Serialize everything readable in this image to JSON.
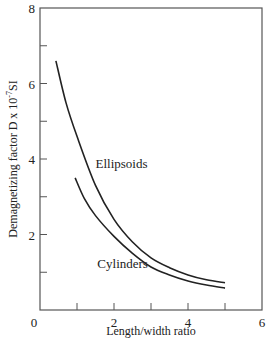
{
  "chart_data": {
    "type": "line",
    "title": "",
    "xlabel": "Length/width ratio",
    "ylabel": "Demagnetizing factor  D x 10",
    "ylabel_sup": "-7",
    "ylabel_unit": "SI",
    "xlim": [
      0,
      6
    ],
    "ylim": [
      0,
      8
    ],
    "x_ticks": [
      0,
      1,
      2,
      3,
      4,
      5,
      6
    ],
    "x_tick_labels": [
      "0",
      "",
      "2",
      "",
      "4",
      "",
      "6"
    ],
    "y_ticks": [
      0,
      1,
      2,
      3,
      4,
      5,
      6,
      7,
      8
    ],
    "y_tick_labels": [
      "",
      "",
      "2",
      "",
      "4",
      "",
      "6",
      "",
      "8"
    ],
    "grid": false,
    "legend": "none (inline curve labels)",
    "series": [
      {
        "name": "Ellipsoids",
        "x": [
          0.43,
          0.7,
          1.0,
          1.5,
          2.0,
          2.5,
          3.0,
          3.5,
          4.0,
          4.5,
          5.0
        ],
        "y": [
          6.6,
          5.5,
          4.6,
          3.3,
          2.4,
          1.8,
          1.38,
          1.12,
          0.93,
          0.8,
          0.72
        ]
      },
      {
        "name": "Cylinders",
        "x": [
          0.95,
          1.2,
          1.5,
          2.0,
          2.5,
          3.0,
          3.5,
          4.0,
          4.5,
          5.0
        ],
        "y": [
          3.5,
          2.95,
          2.5,
          1.95,
          1.5,
          1.14,
          0.93,
          0.77,
          0.66,
          0.58
        ]
      }
    ],
    "annotations": [
      {
        "text": "Ellipsoids",
        "x": 1.5,
        "y": 3.75
      },
      {
        "text": "Cylinders",
        "x": 1.55,
        "y": 1.1
      }
    ]
  }
}
